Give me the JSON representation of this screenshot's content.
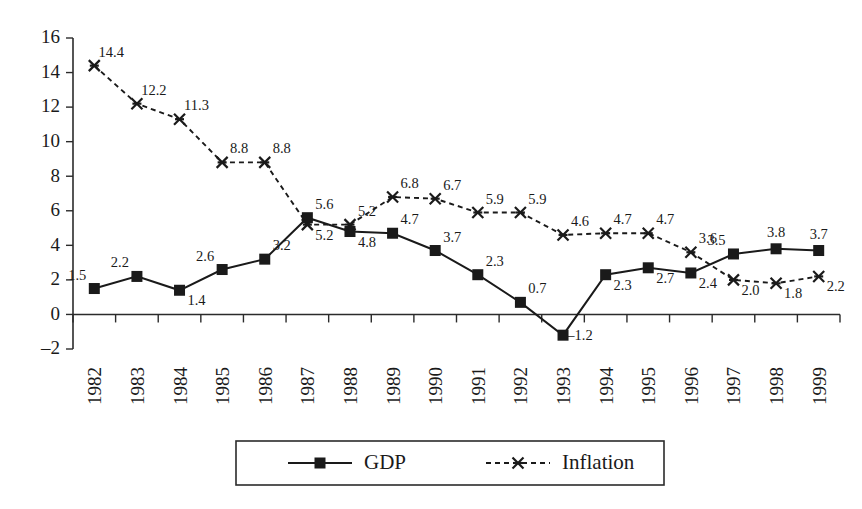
{
  "chart_data": {
    "type": "line",
    "title": "",
    "subtitle": "",
    "xlabel": "",
    "ylabel": "",
    "categories": [
      "1982",
      "1983",
      "1984",
      "1985",
      "1986",
      "1987",
      "1988",
      "1989",
      "1990",
      "1991",
      "1992",
      "1993",
      "1994",
      "1995",
      "1996",
      "1997",
      "1998",
      "1999"
    ],
    "ylim": [
      -2,
      16
    ],
    "yticks": [
      -2,
      0,
      2,
      4,
      6,
      8,
      10,
      12,
      14,
      16
    ],
    "ytick_labels": [
      "–2",
      "0",
      "2",
      "4",
      "6",
      "8",
      "10",
      "12",
      "14",
      "16"
    ],
    "grid": false,
    "legend_position": "bottom",
    "series": [
      {
        "name": "GDP",
        "marker": "filled-square",
        "linestyle": "solid",
        "color": "#1a1a1a",
        "values": [
          1.5,
          2.2,
          1.4,
          2.6,
          3.2,
          5.6,
          4.8,
          4.7,
          3.7,
          2.3,
          0.7,
          -1.2,
          2.3,
          2.7,
          2.4,
          3.5,
          3.8,
          3.7
        ],
        "point_labels": [
          "1.5",
          "2.2",
          "1.4",
          "2.6",
          "3.2",
          "5.6",
          "4.8",
          "4.7",
          "3.7",
          "2.3",
          "0.7",
          "–1.2",
          "2.3",
          "2.7",
          "2.4",
          "3.5",
          "3.8",
          "3.7"
        ],
        "label_positions": [
          "above-left",
          "above-left",
          "below-right",
          "above-left",
          "above-right",
          "above-right",
          "below-right",
          "above-right",
          "above-right",
          "above-right",
          "above-right",
          "right",
          "below-right",
          "below-right",
          "below-right",
          "above-left",
          "above",
          "above"
        ]
      },
      {
        "name": "Inflation",
        "marker": "x-cross",
        "linestyle": "dotted",
        "color": "#1a1a1a",
        "values": [
          14.4,
          12.2,
          11.3,
          8.8,
          8.8,
          5.2,
          5.2,
          6.8,
          6.7,
          5.9,
          5.9,
          4.6,
          4.7,
          4.7,
          3.6,
          2.0,
          1.8,
          2.2
        ],
        "point_labels": [
          "14.4",
          "12.2",
          "11.3",
          "8.8",
          "8.8",
          "5.2",
          "5.2",
          "6.8",
          "6.7",
          "5.9",
          "5.9",
          "4.6",
          "4.7",
          "4.7",
          "3.6",
          "2.0",
          "1.8",
          "2.2"
        ],
        "label_positions": [
          "above-right",
          "above-right",
          "above-right",
          "above-right",
          "above-right",
          "below-right",
          "above-right",
          "above-right",
          "above-right",
          "above-right",
          "above-right",
          "above-right",
          "above-right",
          "above-right",
          "above-right",
          "below-right",
          "below-right",
          "below-right"
        ]
      }
    ]
  },
  "legend": {
    "items": [
      {
        "label": "GDP",
        "marker": "filled-square",
        "linestyle": "solid"
      },
      {
        "label": "Inflation",
        "marker": "x-cross",
        "linestyle": "dotted"
      }
    ]
  }
}
